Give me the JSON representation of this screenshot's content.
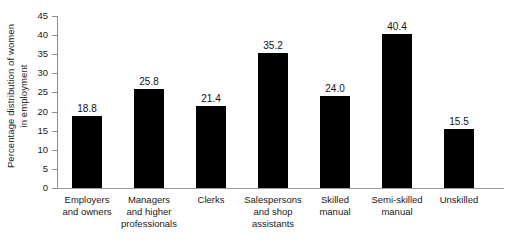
{
  "chart_data": {
    "type": "bar",
    "title": "",
    "subtitle": "",
    "xlabel": "",
    "ylabel": "Percentage distribution of women in employment",
    "ylabel_lines": [
      "Percentage distribution of women",
      "in employment"
    ],
    "categories": [
      "Employers and owners",
      "Managers and higher professionals",
      "Clerks",
      "Salespersons and shop assistants",
      "Skilled manual",
      "Semi-skilled manual",
      "Unskilled"
    ],
    "category_lines": [
      [
        "Employers",
        "and owners"
      ],
      [
        "Managers",
        "and higher",
        "professionals"
      ],
      [
        "Clerks"
      ],
      [
        "Salespersons",
        "and shop",
        "assistants"
      ],
      [
        "Skilled",
        "manual"
      ],
      [
        "Semi-skilled",
        "manual"
      ],
      [
        "Unskilled"
      ]
    ],
    "values": [
      18.8,
      25.8,
      21.4,
      35.2,
      24.0,
      40.4,
      15.5
    ],
    "value_labels": [
      "18.8",
      "25.8",
      "21.4",
      "35.2",
      "24.0",
      "40.4",
      "15.5"
    ],
    "ylim": [
      0,
      45
    ],
    "ytick_values": [
      0,
      5,
      10,
      15,
      20,
      25,
      30,
      35,
      40,
      45
    ],
    "ytick_labels": [
      "0",
      "5",
      "10",
      "15",
      "20",
      "25",
      "30",
      "35",
      "40",
      "45"
    ],
    "grid": false,
    "legend": false,
    "legend_position": "none",
    "bar_color": "#000000",
    "axis_color": "#8d8d8d",
    "background_color": "#ffffff"
  }
}
